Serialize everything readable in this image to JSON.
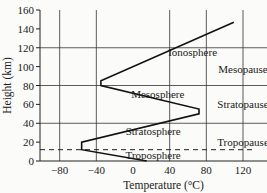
{
  "chart_data": {
    "type": "line",
    "title": "",
    "xlabel": "Temperature (°C)",
    "ylabel": "Height (km)",
    "xlim": [
      -100,
      130
    ],
    "ylim": [
      0,
      160
    ],
    "xticks": [
      -80,
      -40,
      0,
      40,
      80,
      120
    ],
    "xtick_labels": [
      "−80",
      "−40",
      "0",
      "40",
      "80",
      "120"
    ],
    "yticks": [
      0,
      20,
      40,
      60,
      80,
      100,
      120,
      140,
      160
    ],
    "ytick_labels": [
      "0",
      "20",
      "40",
      "60",
      "80",
      "100",
      "120",
      "140",
      "160"
    ],
    "grid": true,
    "grid_x": [
      -80,
      -40,
      40,
      80,
      120
    ],
    "grid_y": [
      40,
      80,
      120
    ],
    "series": [
      {
        "name": "Temperature profile",
        "x": [
          15,
          -56,
          -56,
          72,
          72,
          -35,
          -35,
          110
        ],
        "y": [
          0,
          12,
          20,
          50,
          55,
          80,
          85,
          147
        ]
      }
    ],
    "reference_lines": [
      {
        "type": "horizontal",
        "y": 12,
        "style": "dashed",
        "label": "Tropopause"
      }
    ],
    "annotations": [
      {
        "text": "Ionosphere",
        "x": 65,
        "y": 115
      },
      {
        "text": "Mesopause",
        "x": 120,
        "y": 98
      },
      {
        "text": "Mesosphere",
        "x": 27,
        "y": 71
      },
      {
        "text": "Stratopause",
        "x": 120,
        "y": 60
      },
      {
        "text": "Stratosphere",
        "x": 22,
        "y": 32
      },
      {
        "text": "Tropopause",
        "x": 120,
        "y": 20
      },
      {
        "text": "Troposphere",
        "x": 22,
        "y": 6
      }
    ]
  }
}
